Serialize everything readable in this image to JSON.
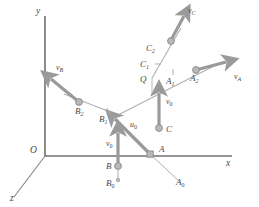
{
  "figure": {
    "background": "#ffffff",
    "colors": {
      "axis": "#6e6e6e",
      "ray": "#a9a9a9",
      "arrow": "#9a9a9a",
      "node_fill": "#b5b5b5",
      "node_stroke": "#8a8a8a",
      "label": "#4a4a4a"
    },
    "axes": [
      {
        "name": "y-axis",
        "label": "y",
        "label_x": 36,
        "label_y": 14
      },
      {
        "name": "x-axis",
        "label": "x",
        "label_x": 226,
        "label_y": 166
      },
      {
        "name": "z-axis",
        "label": "z",
        "label_x": 10,
        "label_y": 201
      },
      {
        "name": "origin",
        "label": "O",
        "label_x": 30,
        "label_y": 153
      }
    ],
    "points": [
      {
        "id": "Q",
        "label": "Q",
        "sub": "",
        "x": 152,
        "y": 78,
        "label_x": 140,
        "label_y": 82,
        "node": false
      },
      {
        "id": "C",
        "label": "C",
        "sub": "",
        "x": 159,
        "y": 128,
        "label_x": 166,
        "label_y": 132,
        "node": true
      },
      {
        "id": "C1",
        "label": "C",
        "sub": "1",
        "x": 158,
        "y": 63,
        "label_x": 140,
        "label_y": 67,
        "node": false
      },
      {
        "id": "C2",
        "label": "C",
        "sub": "2",
        "x": 171,
        "y": 41,
        "label_x": 146,
        "label_y": 51,
        "node": true
      },
      {
        "id": "A",
        "label": "A",
        "sub": "",
        "x": 150,
        "y": 154,
        "label_x": 159,
        "label_y": 152,
        "node": true
      },
      {
        "id": "A0",
        "label": "A",
        "sub": "0",
        "x": 178,
        "y": 180,
        "label_x": 176,
        "label_y": 185,
        "node": false
      },
      {
        "id": "A1",
        "label": "A",
        "sub": "1",
        "x": 173,
        "y": 73,
        "label_x": 166,
        "label_y": 84,
        "node": false
      },
      {
        "id": "A2",
        "label": "A",
        "sub": "2",
        "x": 196,
        "y": 70,
        "label_x": 190,
        "label_y": 81,
        "node": true
      },
      {
        "id": "B",
        "label": "B",
        "sub": "",
        "x": 118,
        "y": 166,
        "label_x": 106,
        "label_y": 169,
        "node": true
      },
      {
        "id": "B0",
        "label": "B",
        "sub": "0",
        "x": 118,
        "y": 180,
        "label_x": 106,
        "label_y": 186,
        "node": false
      },
      {
        "id": "B1",
        "label": "B",
        "sub": "1",
        "x": 105,
        "y": 112,
        "label_x": 99,
        "label_y": 122,
        "node": false
      },
      {
        "id": "B2",
        "label": "B",
        "sub": "2",
        "x": 79,
        "y": 102,
        "label_x": 75,
        "label_y": 114,
        "node": true
      }
    ],
    "vectors": [
      {
        "id": "vC",
        "label": "v",
        "sub": "C",
        "label_x": 188,
        "label_y": 13
      },
      {
        "id": "vA",
        "label": "v",
        "sub": "A",
        "label_x": 234,
        "label_y": 79
      },
      {
        "id": "vB",
        "label": "v",
        "sub": "B",
        "label_x": 56,
        "label_y": 70
      },
      {
        "id": "u0",
        "label": "u",
        "sub": "0",
        "label_x": 130,
        "label_y": 127
      },
      {
        "id": "v0_C",
        "label": "v",
        "sub": "0",
        "label_x": 166,
        "label_y": 104
      },
      {
        "id": "v0_B",
        "label": "v",
        "sub": "0",
        "label_x": 106,
        "label_y": 146
      }
    ]
  }
}
